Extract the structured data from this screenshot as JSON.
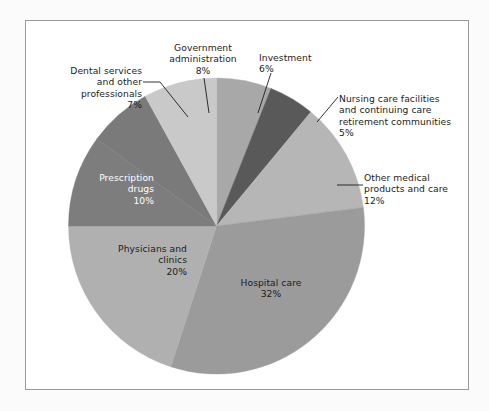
{
  "figure": {
    "background_color": "#ffffff",
    "frame_color": "#9a9a9a"
  },
  "chart_data": {
    "type": "pie",
    "title": "",
    "subtitle": "",
    "xlabel": "",
    "ylabel": "",
    "legend_position": "none",
    "grid": false,
    "units": "percent",
    "start_angle_deg": 0,
    "direction": "clockwise",
    "categories": [
      "Investment",
      "Nursing care facilities and continuing care retirement communities",
      "Other medical products and care",
      "Hospital care",
      "Physicians and clinics",
      "Prescription drugs",
      "Dental services and other professionals",
      "Government administration"
    ],
    "values": [
      6,
      5,
      12,
      32,
      20,
      10,
      7,
      8
    ],
    "colors": [
      "#a8a8a8",
      "#595959",
      "#b6b6b6",
      "#9b9b9b",
      "#b0b0b0",
      "#7d7d7d",
      "#7a7a7a",
      "#c9c9c9"
    ],
    "slices": [
      {
        "name": "Investment",
        "value": 6,
        "value_label": "6%",
        "label": "Investment",
        "label_text": "Investment\n6%",
        "color": "#a8a8a8",
        "label_placement": "outside",
        "label_align": "left",
        "text_color": "#1c1c1c"
      },
      {
        "name": "Nursing care facilities and continuing care retirement communities",
        "value": 5,
        "value_label": "5%",
        "label": "Nursing care facilities and continuing care retirement communities",
        "label_text": "Nursing care facilities\nand continuing care\nretirement communities\n5%",
        "color": "#595959",
        "label_placement": "outside",
        "label_align": "left",
        "text_color": "#1c1c1c"
      },
      {
        "name": "Other medical products and care",
        "value": 12,
        "value_label": "12%",
        "label": "Other medical products and care",
        "label_text": "Other medical\nproducts and care\n12%",
        "color": "#b6b6b6",
        "label_placement": "outside",
        "label_align": "left",
        "text_color": "#1c1c1c"
      },
      {
        "name": "Hospital care",
        "value": 32,
        "value_label": "32%",
        "label": "Hospital care",
        "label_text": "Hospital care\n32%",
        "color": "#9b9b9b",
        "label_placement": "inside",
        "label_align": "center",
        "text_color": "#1c1c1c"
      },
      {
        "name": "Physicians and clinics",
        "value": 20,
        "value_label": "20%",
        "label": "Physicians and clinics",
        "label_text": "Physicians and\nclinics\n20%",
        "color": "#b0b0b0",
        "label_placement": "inside",
        "label_align": "right",
        "text_color": "#1c1c1c"
      },
      {
        "name": "Prescription drugs",
        "value": 10,
        "value_label": "10%",
        "label": "Prescription drugs",
        "label_text": "Prescription\ndrugs\n10%",
        "color": "#7d7d7d",
        "label_placement": "inside",
        "label_align": "right",
        "text_color": "#ffffff"
      },
      {
        "name": "Dental services and other professionals",
        "value": 7,
        "value_label": "7%",
        "label": "Dental services and other professionals",
        "label_text": "Dental services\nand other\nprofessionals\n7%",
        "color": "#7a7a7a",
        "label_placement": "outside",
        "label_align": "right",
        "text_color": "#1c1c1c"
      },
      {
        "name": "Government administration",
        "value": 8,
        "value_label": "8%",
        "label": "Government administration",
        "label_text": "Government\nadministration\n8%",
        "color": "#c9c9c9",
        "label_placement": "outside",
        "label_align": "center",
        "text_color": "#1c1c1c"
      }
    ]
  }
}
